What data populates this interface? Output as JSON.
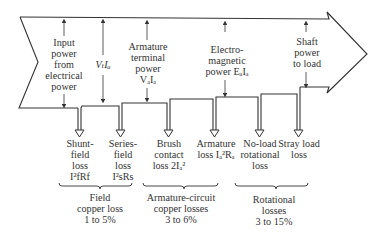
{
  "diagram": {
    "type": "power-flow",
    "title": "",
    "flow_labels": {
      "input": "Input\npower\nfrom\nelectrical\npower",
      "vt_ia": "VₜIₐ",
      "armature_terminal": "Armature\nterminal\npower\nVₐIₐ",
      "electromagnetic": "Electro-\nmagnetic\npower EₐIₐ",
      "shaft": "Shaft\npower\nto load"
    },
    "losses": [
      {
        "label": "Shunt-\nfield\nloss\nI²fRf"
      },
      {
        "label": "Series-\nfield\nloss\nI²sRs"
      },
      {
        "label": "Brush\ncontact\nloss 2Iₐ²"
      },
      {
        "label": "Armature\nloss Iₐ²Rₐ"
      },
      {
        "label": "No-load\nrotational\nloss"
      },
      {
        "label": "Stray load\nloss"
      }
    ],
    "groups": [
      {
        "label": "Field\ncopper loss\n1 to 5%"
      },
      {
        "label": "Armature-circuit\ncopper losses\n3 to 6%"
      },
      {
        "label": "Rotational\nlosses\n3 to 15%"
      }
    ],
    "colors": {
      "line": "#333333",
      "text": "#333333",
      "background": "#ffffff"
    }
  }
}
